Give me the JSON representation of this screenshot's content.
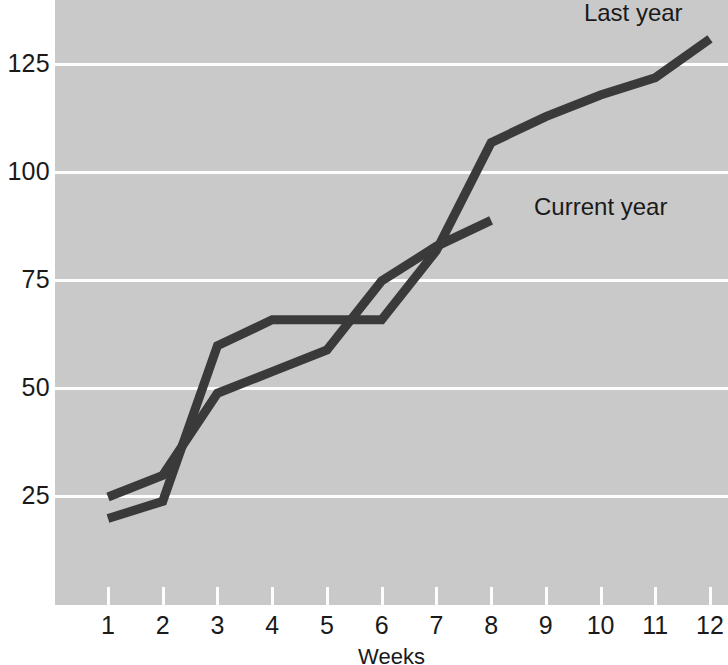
{
  "chart_data": {
    "type": "line",
    "title": "",
    "subtitle": "",
    "xlabel": "Weeks",
    "ylabel": "",
    "x": [
      1,
      2,
      3,
      4,
      5,
      6,
      7,
      8,
      9,
      10,
      11,
      12
    ],
    "categories": [
      "1",
      "2",
      "3",
      "4",
      "5",
      "6",
      "7",
      "8",
      "9",
      "10",
      "11",
      "12"
    ],
    "xlim": [
      1,
      12
    ],
    "ylim": [
      0,
      140
    ],
    "y_ticks": [
      25,
      50,
      75,
      100,
      125
    ],
    "y_tick_labels": [
      "25",
      "50",
      "75",
      "100",
      "125"
    ],
    "x_ticks": [
      1,
      2,
      3,
      4,
      5,
      6,
      7,
      8,
      9,
      10,
      11,
      12
    ],
    "x_tick_labels": [
      "1",
      "2",
      "3",
      "4",
      "5",
      "6",
      "7",
      "8",
      "9",
      "10",
      "11",
      "12"
    ],
    "grid": "horizontal",
    "legend_position": "inline-annotation",
    "series": [
      {
        "name": "Last year",
        "label": "Last year",
        "color": "#3a3a3a",
        "x": [
          1,
          2,
          3,
          4,
          5,
          6,
          7,
          8,
          9,
          10,
          11,
          12
        ],
        "values": [
          20,
          24,
          60,
          66,
          66,
          66,
          82,
          107,
          113,
          118,
          122,
          131
        ]
      },
      {
        "name": "Current year",
        "label": "Current year",
        "color": "#3a3a3a",
        "x": [
          1,
          2,
          3,
          4,
          5,
          6,
          7,
          8
        ],
        "values": [
          25,
          30,
          49,
          54,
          59,
          75,
          83,
          89
        ]
      }
    ],
    "annotations": [
      {
        "text": "Last year",
        "x": 10.6,
        "y": 137
      },
      {
        "text": "Current year",
        "x": 10.0,
        "y": 92
      }
    ]
  },
  "style": {
    "plot_background": "#c9c9c9",
    "gridline_color": "#fdfdfd",
    "line_color": "#3a3a3a",
    "text_color": "#1a1a1a",
    "page_background": "#ffffff",
    "line_width": 9
  }
}
